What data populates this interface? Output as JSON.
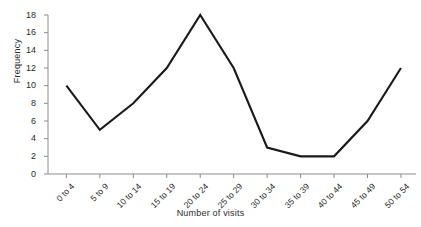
{
  "chart_data": {
    "type": "line",
    "title": "",
    "xlabel": "Number of visits",
    "ylabel": "Frequency",
    "categories": [
      "0 to 4",
      "5 to 9",
      "10 to 14",
      "15 to 19",
      "20 to 24",
      "25 to 29",
      "30 to 34",
      "35 to 39",
      "40 to 44",
      "45 to 49",
      "50 to 54"
    ],
    "values": [
      10,
      5,
      8,
      12,
      18,
      12,
      3,
      2,
      2,
      6,
      12
    ],
    "ylim": [
      0,
      18
    ],
    "ytick_labels": [
      "0",
      "2",
      "4",
      "6",
      "8",
      "10",
      "12",
      "14",
      "16",
      "18"
    ],
    "ytick_values": [
      0,
      2,
      4,
      6,
      8,
      10,
      12,
      14,
      16,
      18
    ],
    "grid": false,
    "legend": false,
    "line_color": "#1a1a1a",
    "axis_color": "#8c8c8c",
    "background_color": "#ffffff"
  }
}
